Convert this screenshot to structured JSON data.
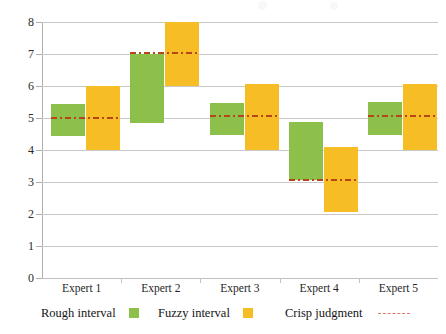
{
  "chart_data": {
    "type": "bar",
    "title": "",
    "subtitle": "",
    "xlabel": "",
    "ylabel": "",
    "ylim": [
      0,
      8
    ],
    "ytick_step": 1,
    "grid": true,
    "legend_position": "bottom",
    "categories": [
      "Expert 1",
      "Expert 2",
      "Expert 3",
      "Expert 4",
      "Expert 5"
    ],
    "ytick_labels": [
      "8",
      "7",
      "6",
      "5",
      "4",
      "3",
      "2",
      "1",
      "0"
    ],
    "series": [
      {
        "name": "Rough interval",
        "type": "range-bar",
        "color": "#8DC04A",
        "lows": [
          4.45,
          4.85,
          4.48,
          3.05,
          4.48
        ],
        "highs": [
          5.45,
          7.0,
          5.48,
          4.87,
          5.5
        ]
      },
      {
        "name": "Fuzzy interval",
        "type": "range-bar",
        "color": "#F6BD24",
        "lows": [
          4.0,
          6.0,
          4.0,
          2.05,
          4.0
        ],
        "highs": [
          6.0,
          8.0,
          6.05,
          4.1,
          6.05
        ]
      },
      {
        "name": "Crisp judgment",
        "type": "marker-line",
        "color": "#B5461B",
        "style": "dash-dot",
        "values": [
          5.0,
          7.02,
          5.05,
          3.06,
          5.07
        ]
      }
    ]
  },
  "legend": {
    "items": [
      {
        "label": "Rough interval",
        "marker": "green-square-swatch",
        "color": "#8DC04A"
      },
      {
        "label": "Fuzzy interval",
        "marker": "yellow-square-swatch",
        "color": "#F6BD24"
      },
      {
        "label": "Crisp judgment",
        "marker": "dashed-line-swatch",
        "color": "#D8796A"
      }
    ]
  },
  "axes": {
    "y": {
      "min": 0,
      "max": 8,
      "ticks": [
        8,
        7,
        6,
        5,
        4,
        3,
        2,
        1,
        0
      ]
    },
    "x": {
      "categories": [
        "Expert 1",
        "Expert 2",
        "Expert 3",
        "Expert 4",
        "Expert 5"
      ]
    }
  }
}
